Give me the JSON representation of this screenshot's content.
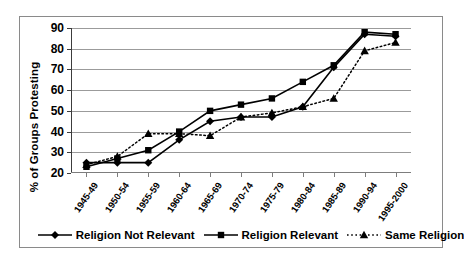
{
  "chart_data": {
    "type": "line",
    "title": "",
    "xlabel": "",
    "ylabel": "% of Groups Protesting",
    "ylim": [
      20,
      90
    ],
    "ytick_values": [
      20,
      30,
      40,
      50,
      60,
      70,
      80,
      90
    ],
    "ytick_labels": [
      "20",
      "30",
      "40",
      "50",
      "60",
      "70",
      "80",
      "90"
    ],
    "grid": true,
    "legend_position": "bottom",
    "categories": [
      "1945-49",
      "1950-54",
      "1955-59",
      "1960-64",
      "1965-69",
      "1970-74",
      "1975-79",
      "1980-84",
      "1985-89",
      "1990-94",
      "1995-2000"
    ],
    "series": [
      {
        "name": "Religion Not Relevant",
        "marker": "diamond",
        "linestyle": "solid",
        "color": "#000000",
        "values": [
          25,
          25,
          25,
          36,
          45,
          47,
          47,
          52,
          71,
          87,
          86
        ]
      },
      {
        "name": "Religion Relevant",
        "marker": "square",
        "linestyle": "solid",
        "color": "#000000",
        "values": [
          23,
          27,
          31,
          40,
          50,
          53,
          56,
          64,
          72,
          88,
          87
        ]
      },
      {
        "name": "Same Religion",
        "marker": "triangle",
        "linestyle": "dotted",
        "color": "#000000",
        "values": [
          24,
          28,
          39,
          39,
          38,
          47,
          49,
          52,
          56,
          79,
          83
        ]
      }
    ]
  },
  "legend": {
    "items": [
      {
        "label": "Religion Not Relevant",
        "marker": "diamond",
        "linestyle": "solid"
      },
      {
        "label": "Religion Relevant",
        "marker": "square",
        "linestyle": "solid"
      },
      {
        "label": "Same Religion",
        "marker": "triangle",
        "linestyle": "dotted"
      }
    ]
  },
  "axes": {
    "y_title": "% of Groups Protesting"
  }
}
